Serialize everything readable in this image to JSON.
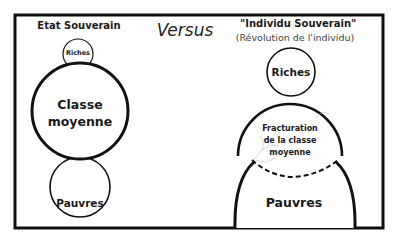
{
  "diagram": {
    "left": {
      "title": "Etat Souverain",
      "nodes": {
        "riches": "Riches",
        "classe_moyenne_line1": "Classe",
        "classe_moyenne_line2": "moyenne",
        "pauvres": "Pauvres"
      }
    },
    "center": {
      "label": "Versus"
    },
    "right": {
      "title": "\"Individu Souverain\"",
      "subtitle": "(Révolution de l'individu)",
      "nodes": {
        "riches": "Riches",
        "fracture_line1": "Fracturation",
        "fracture_line2": "de la classe",
        "fracture_line3": "moyenne",
        "pauvres": "Pauvres"
      }
    },
    "colors": {
      "stroke": "#111111",
      "crack": "#bbbbbb",
      "background": "#ffffff"
    }
  }
}
